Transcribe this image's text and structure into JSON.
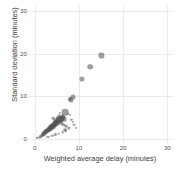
{
  "chart_data": {
    "type": "scatter",
    "title": "",
    "xlabel": "Weighted average delay (minutes)",
    "ylabel": "Standard deviation (minutes)",
    "xlim": [
      -1.5,
      31.5
    ],
    "ylim": [
      -1.5,
      31.5
    ],
    "xticks": [
      0,
      10,
      20,
      30
    ],
    "yticks": [
      0,
      10,
      20,
      30
    ],
    "xtick_labels": [
      "0",
      "10",
      "20",
      "30"
    ],
    "ytick_labels": [
      "0",
      "10",
      "20",
      "30"
    ],
    "grid": true,
    "grid_color": "#ebebeb",
    "background": "#ffffff",
    "point_color": "#4d4d4d",
    "point_opacity": 0.55,
    "legend": "none",
    "points": [
      {
        "x": 15.1,
        "y": 19.6,
        "size": 5.2
      },
      {
        "x": 12.6,
        "y": 17.0,
        "size": 5.6
      },
      {
        "x": 10.7,
        "y": 14.0,
        "size": 5.2
      },
      {
        "x": 8.6,
        "y": 9.9,
        "size": 5.0
      },
      {
        "x": 8.2,
        "y": 9.2,
        "size": 5.0
      },
      {
        "x": 7.9,
        "y": 9.4,
        "size": 4.2
      },
      {
        "x": 6.9,
        "y": 6.3,
        "size": 6.6
      },
      {
        "x": 7.5,
        "y": 5.9,
        "size": 2.4
      },
      {
        "x": 6.4,
        "y": 5.2,
        "size": 5.4
      },
      {
        "x": 6.2,
        "y": 4.9,
        "size": 6.0
      },
      {
        "x": 6.8,
        "y": 4.6,
        "size": 4.6
      },
      {
        "x": 5.9,
        "y": 4.6,
        "size": 5.8
      },
      {
        "x": 5.6,
        "y": 4.3,
        "size": 6.4
      },
      {
        "x": 5.3,
        "y": 4.1,
        "size": 5.2
      },
      {
        "x": 5.1,
        "y": 3.8,
        "size": 6.8
      },
      {
        "x": 4.8,
        "y": 3.6,
        "size": 5.6
      },
      {
        "x": 4.6,
        "y": 3.4,
        "size": 6.2
      },
      {
        "x": 4.4,
        "y": 3.2,
        "size": 5.0
      },
      {
        "x": 4.2,
        "y": 3.0,
        "size": 5.8
      },
      {
        "x": 4.0,
        "y": 2.9,
        "size": 4.8
      },
      {
        "x": 3.8,
        "y": 2.7,
        "size": 5.4
      },
      {
        "x": 3.6,
        "y": 2.5,
        "size": 4.6
      },
      {
        "x": 3.4,
        "y": 2.4,
        "size": 5.2
      },
      {
        "x": 3.2,
        "y": 2.2,
        "size": 4.4
      },
      {
        "x": 3.0,
        "y": 2.0,
        "size": 5.0
      },
      {
        "x": 2.8,
        "y": 1.9,
        "size": 4.2
      },
      {
        "x": 2.6,
        "y": 1.7,
        "size": 4.6
      },
      {
        "x": 2.4,
        "y": 1.5,
        "size": 4.0
      },
      {
        "x": 2.2,
        "y": 1.3,
        "size": 4.4
      },
      {
        "x": 2.0,
        "y": 1.1,
        "size": 3.6
      },
      {
        "x": 1.8,
        "y": 0.9,
        "size": 3.8
      },
      {
        "x": 1.5,
        "y": 0.6,
        "size": 3.2
      },
      {
        "x": 1.2,
        "y": 0.4,
        "size": 2.8
      },
      {
        "x": 0.6,
        "y": 0.2,
        "size": 2.4
      },
      {
        "x": 5.4,
        "y": 5.3,
        "size": 3.4
      },
      {
        "x": 5.0,
        "y": 4.9,
        "size": 3.0
      },
      {
        "x": 6.1,
        "y": 3.6,
        "size": 3.2
      },
      {
        "x": 6.6,
        "y": 3.3,
        "size": 3.0
      },
      {
        "x": 7.2,
        "y": 3.0,
        "size": 2.6
      },
      {
        "x": 7.8,
        "y": 2.6,
        "size": 3.0
      },
      {
        "x": 8.3,
        "y": 4.5,
        "size": 2.4
      },
      {
        "x": 8.7,
        "y": 4.0,
        "size": 2.2
      },
      {
        "x": 9.0,
        "y": 3.3,
        "size": 2.6
      },
      {
        "x": 9.4,
        "y": 2.6,
        "size": 2.2
      },
      {
        "x": 8.0,
        "y": 5.6,
        "size": 2.0
      },
      {
        "x": 7.0,
        "y": 1.8,
        "size": 2.8
      },
      {
        "x": 6.3,
        "y": 1.5,
        "size": 2.6
      },
      {
        "x": 5.5,
        "y": 1.2,
        "size": 2.4
      },
      {
        "x": 4.7,
        "y": 1.0,
        "size": 2.2
      },
      {
        "x": 4.0,
        "y": 0.7,
        "size": 2.4
      },
      {
        "x": 3.3,
        "y": 0.5,
        "size": 2.2
      },
      {
        "x": 2.7,
        "y": 0.3,
        "size": 2.0
      },
      {
        "x": 6.9,
        "y": 2.1,
        "size": 3.6
      },
      {
        "x": 5.8,
        "y": 6.0,
        "size": 2.2
      },
      {
        "x": 4.5,
        "y": 4.4,
        "size": 3.6
      },
      {
        "x": 4.2,
        "y": 4.8,
        "size": 2.6
      }
    ]
  }
}
